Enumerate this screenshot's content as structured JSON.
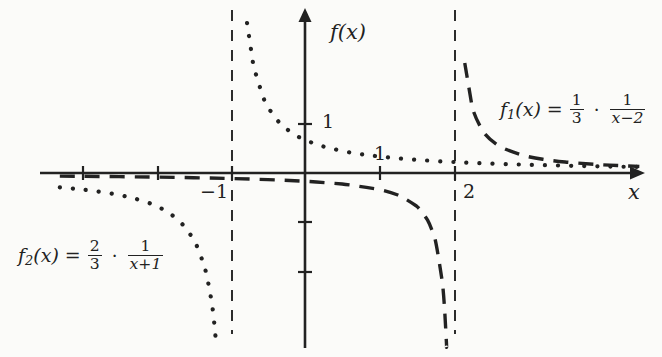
{
  "figure": {
    "background_color": "#fbfbf9",
    "ink_color": "#222222"
  },
  "axes": {
    "y_axis_label": "f(x)",
    "x_axis_label": "x",
    "x_tick_label_neg1": "−1",
    "x_tick_label_1": "1",
    "x_tick_label_2": "2",
    "y_tick_label_1": "1"
  },
  "labels": {
    "f1": {
      "name": "f",
      "sub": "1",
      "arg": "(x)",
      "equals": "=",
      "coef_num": "1",
      "coef_den": "3",
      "dot": "·",
      "frac_num": "1",
      "frac_den": "x−2",
      "plain": "f1(x) = 1/3 · 1/(x−2)"
    },
    "f2": {
      "name": "f",
      "sub": "2",
      "arg": "(x)",
      "equals": "=",
      "coef_num": "2",
      "coef_den": "3",
      "dot": "·",
      "frac_num": "1",
      "frac_den": "x+1",
      "plain": "f2(x) = 2/3 · 1/(x+1)"
    }
  },
  "chart_data": {
    "type": "line",
    "title": "",
    "xlabel": "x",
    "ylabel": "f(x)",
    "xlim": [
      -3.3,
      4.5
    ],
    "ylim": [
      -3.6,
      3.5
    ],
    "grid": false,
    "legend": "inline-annotations",
    "x_ticks": [
      -3,
      -2,
      -1,
      1,
      2
    ],
    "y_ticks": [
      1,
      -1,
      -2
    ],
    "x_tick_labels_shown": [
      "−1",
      "1",
      "2"
    ],
    "y_tick_labels_shown": [
      "1"
    ],
    "series": [
      {
        "name": "f1",
        "label": "f1(x) = 1/3 · 1/(x−2)",
        "expression": "(1/3)*(1/(x-2))",
        "coefficient": 0.3333333,
        "vertical_asymptote": 2,
        "horizontal_asymptote": 0,
        "style": "dashed",
        "color": "#222222",
        "branches": [
          {
            "side": "left",
            "x": [
              -3.3,
              -3.0,
              -2.5,
              -2.0,
              -1.5,
              -1.0,
              -0.5,
              0.0,
              0.5,
              1.0,
              1.25,
              1.5,
              1.65,
              1.75,
              1.85,
              1.9,
              1.94,
              1.96,
              1.97
            ],
            "y": [
              -0.0629,
              -0.0667,
              -0.0741,
              -0.0833,
              -0.0952,
              -0.1111,
              -0.1333,
              -0.1667,
              -0.2222,
              -0.3333,
              -0.4444,
              -0.6667,
              -0.9524,
              -1.3333,
              -2.2222,
              -3.3333,
              -5.5556,
              -8.3333,
              -11.111
            ]
          },
          {
            "side": "right",
            "x": [
              2.03,
              2.04,
              2.06,
              2.1,
              2.15,
              2.25,
              2.4,
              2.6,
              2.9,
              3.2,
              3.5,
              3.9,
              4.2,
              4.5
            ],
            "y": [
              11.111,
              8.3333,
              5.5556,
              3.3333,
              2.2222,
              1.3333,
              0.8333,
              0.5556,
              0.3704,
              0.2778,
              0.2222,
              0.1754,
              0.1515,
              0.1333
            ]
          }
        ]
      },
      {
        "name": "f2",
        "label": "f2(x) = 2/3 · 1/(x+1)",
        "expression": "(2/3)*(1/(x+1))",
        "coefficient": 0.6666667,
        "vertical_asymptote": -1,
        "horizontal_asymptote": 0,
        "style": "dotted",
        "color": "#222222",
        "branches": [
          {
            "side": "left",
            "x": [
              -3.3,
              -3.1,
              -2.9,
              -2.7,
              -2.5,
              -2.3,
              -2.1,
              -1.9,
              -1.7,
              -1.5,
              -1.35,
              -1.25,
              -1.18,
              -1.12,
              -1.08,
              -1.06,
              -1.05
            ],
            "y": [
              -0.2899,
              -0.3175,
              -0.3509,
              -0.3922,
              -0.4444,
              -0.5128,
              -0.6061,
              -0.7407,
              -0.9524,
              -1.3333,
              -1.9048,
              -2.6667,
              -3.7037,
              -5.5556,
              -8.3333,
              -11.111,
              -13.333
            ]
          },
          {
            "side": "right",
            "x": [
              -0.95,
              -0.94,
              -0.92,
              -0.9,
              -0.85,
              -0.78,
              -0.7,
              -0.55,
              -0.35,
              -0.1,
              0.2,
              0.6,
              1.0,
              1.5,
              2.0,
              2.6,
              3.2,
              3.8,
              4.5
            ],
            "y": [
              13.333,
              11.111,
              8.3333,
              6.6667,
              4.4444,
              3.0303,
              2.2222,
              1.4815,
              1.0256,
              0.7407,
              0.5556,
              0.4167,
              0.3333,
              0.2667,
              0.2222,
              0.1852,
              0.1587,
              0.1389,
              0.1212
            ]
          }
        ]
      }
    ],
    "asymptotes": [
      {
        "name": "f1-vertical-asymptote",
        "x": 2,
        "style": "dashed"
      },
      {
        "name": "f2-vertical-asymptote",
        "x": -1,
        "style": "dashed"
      }
    ]
  }
}
